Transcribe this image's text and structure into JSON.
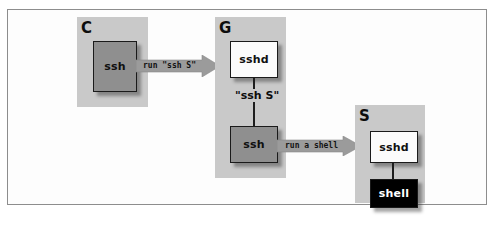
{
  "figure": {
    "kind": "ssh-gateway-diagram",
    "background_color": "#ffffff",
    "frame_border_color": "#8d8d8d",
    "panel_color": "#c9c9c9",
    "box_gray_color": "#8f8f8f",
    "box_white_color": "#fbfbfb",
    "box_black_color": "#000000",
    "arrow_color": "#9b9b9b"
  },
  "hosts": [
    {
      "id": "client",
      "label": "C"
    },
    {
      "id": "gateway",
      "label": "G"
    },
    {
      "id": "server",
      "label": "S"
    }
  ],
  "processes": [
    {
      "id": "client-ssh",
      "label": "ssh",
      "style": "gray"
    },
    {
      "id": "gateway-sshd",
      "label": "sshd",
      "style": "white"
    },
    {
      "id": "gateway-ssh",
      "label": "ssh",
      "style": "gray"
    },
    {
      "id": "server-sshd",
      "label": "sshd",
      "style": "white"
    },
    {
      "id": "server-shell",
      "label": "shell",
      "style": "black"
    }
  ],
  "arrows": [
    {
      "id": "client-to-gateway",
      "label": "run \"ssh S\""
    },
    {
      "id": "gateway-to-server",
      "label": "run a shell"
    }
  ],
  "connector_labels": [
    {
      "id": "gateway-internal",
      "label": "\"ssh S\""
    }
  ],
  "caption_sliver": ""
}
